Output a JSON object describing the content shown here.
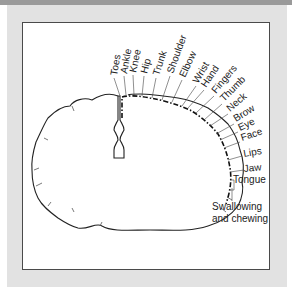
{
  "figure": {
    "labels": {
      "toes": "Toes",
      "ankle": "Ankle",
      "knee": "Knee",
      "hip": "Hip",
      "trunk": "Trunk",
      "shoulder": "Shoulder",
      "elbow": "Elbow",
      "wrist": "Wrist",
      "hand": "Hand",
      "fingers": "Fingers",
      "thumb": "Thumb",
      "neck": "Neck",
      "brow": "Brow",
      "eye": "Eye",
      "face": "Face",
      "lips": "Lips",
      "jaw": "Jaw",
      "tongue": "Tongue",
      "swallowing_line1": "Swallowing",
      "swallowing_line2": "and chewing"
    },
    "colors": {
      "outline": "#222222",
      "frame": "#e2e2e2",
      "band": "#9a9a9a",
      "panel_border": "#4a4a4a"
    }
  }
}
